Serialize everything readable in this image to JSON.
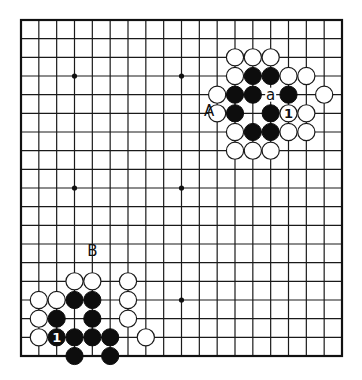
{
  "diagram": {
    "type": "go-board",
    "size": 19,
    "colors": {
      "black_stone": "#0d0d0d",
      "white_stone": "#ffffff",
      "line": "#1a1a1a",
      "background": "#ffffff"
    },
    "star_points": [
      {
        "col": 3,
        "row": 3
      },
      {
        "col": 9,
        "row": 3
      },
      {
        "col": 3,
        "row": 9
      },
      {
        "col": 9,
        "row": 9
      },
      {
        "col": 9,
        "row": 15
      }
    ],
    "stones": [
      {
        "col": 12,
        "row": 2,
        "color": "white"
      },
      {
        "col": 13,
        "row": 2,
        "color": "white"
      },
      {
        "col": 14,
        "row": 2,
        "color": "white"
      },
      {
        "col": 12,
        "row": 3,
        "color": "white"
      },
      {
        "col": 13,
        "row": 3,
        "color": "black"
      },
      {
        "col": 14,
        "row": 3,
        "color": "black"
      },
      {
        "col": 15,
        "row": 3,
        "color": "white"
      },
      {
        "col": 16,
        "row": 3,
        "color": "white"
      },
      {
        "col": 11,
        "row": 4,
        "color": "white"
      },
      {
        "col": 12,
        "row": 4,
        "color": "black"
      },
      {
        "col": 13,
        "row": 4,
        "color": "black"
      },
      {
        "col": 15,
        "row": 4,
        "color": "black"
      },
      {
        "col": 17,
        "row": 4,
        "color": "white"
      },
      {
        "col": 11,
        "row": 5,
        "color": "white"
      },
      {
        "col": 12,
        "row": 5,
        "color": "black"
      },
      {
        "col": 14,
        "row": 5,
        "color": "black"
      },
      {
        "col": 15,
        "row": 5,
        "color": "white",
        "mark": "1"
      },
      {
        "col": 16,
        "row": 5,
        "color": "white"
      },
      {
        "col": 12,
        "row": 6,
        "color": "white"
      },
      {
        "col": 13,
        "row": 6,
        "color": "black"
      },
      {
        "col": 14,
        "row": 6,
        "color": "black"
      },
      {
        "col": 15,
        "row": 6,
        "color": "white"
      },
      {
        "col": 16,
        "row": 6,
        "color": "white"
      },
      {
        "col": 12,
        "row": 7,
        "color": "white"
      },
      {
        "col": 13,
        "row": 7,
        "color": "white"
      },
      {
        "col": 14,
        "row": 7,
        "color": "white"
      },
      {
        "col": 3,
        "row": 14,
        "color": "white"
      },
      {
        "col": 4,
        "row": 14,
        "color": "white"
      },
      {
        "col": 6,
        "row": 14,
        "color": "white"
      },
      {
        "col": 1,
        "row": 15,
        "color": "white"
      },
      {
        "col": 2,
        "row": 15,
        "color": "white"
      },
      {
        "col": 3,
        "row": 15,
        "color": "black"
      },
      {
        "col": 4,
        "row": 15,
        "color": "black"
      },
      {
        "col": 6,
        "row": 15,
        "color": "white"
      },
      {
        "col": 1,
        "row": 16,
        "color": "white"
      },
      {
        "col": 2,
        "row": 16,
        "color": "black"
      },
      {
        "col": 4,
        "row": 16,
        "color": "black"
      },
      {
        "col": 6,
        "row": 16,
        "color": "white"
      },
      {
        "col": 1,
        "row": 17,
        "color": "white"
      },
      {
        "col": 2,
        "row": 17,
        "color": "black",
        "mark": "1"
      },
      {
        "col": 3,
        "row": 17,
        "color": "black"
      },
      {
        "col": 4,
        "row": 17,
        "color": "black"
      },
      {
        "col": 5,
        "row": 17,
        "color": "black"
      },
      {
        "col": 7,
        "row": 17,
        "color": "white"
      },
      {
        "col": 3,
        "row": 18,
        "color": "black"
      },
      {
        "col": 5,
        "row": 18,
        "color": "black"
      }
    ],
    "point_labels": [
      {
        "col": 14,
        "row": 4,
        "text": "a"
      }
    ],
    "side_labels": [
      {
        "col": 10.55,
        "row": 4.85,
        "text": "A"
      },
      {
        "col": 4,
        "row": 12.35,
        "text": "B"
      }
    ]
  }
}
